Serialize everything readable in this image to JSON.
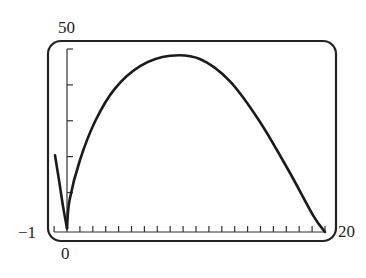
{
  "chart_data": {
    "type": "line",
    "title": "",
    "xlabel": "",
    "ylabel": "",
    "xlim": [
      -1,
      20
    ],
    "ylim": [
      -1,
      50
    ],
    "grid": false,
    "legend": null,
    "x_tick_step": 1,
    "y_tick_step": 10,
    "tick_labels": {
      "y_top": "50",
      "y_bottom": "-1",
      "x_left": "0",
      "x_right": "20"
    },
    "series": [
      {
        "name": "curve-left-branch",
        "x": [
          -0.93,
          -0.6,
          -0.3,
          0
        ],
        "y": [
          20.4,
          13,
          6,
          0
        ]
      },
      {
        "name": "curve-right-branch",
        "x": [
          0,
          0.2,
          1,
          2.2,
          3.7,
          5.7,
          8,
          10.3,
          12.6,
          14.9,
          17.2,
          19.1,
          20
        ],
        "y": [
          0,
          7.9,
          19,
          30,
          38.9,
          45.3,
          48.1,
          47.2,
          41.1,
          30,
          16,
          3.5,
          -1
        ]
      }
    ]
  },
  "labels": {
    "y_top": "50",
    "y_bottom": "−1",
    "x_left": "0",
    "x_right": "20"
  }
}
